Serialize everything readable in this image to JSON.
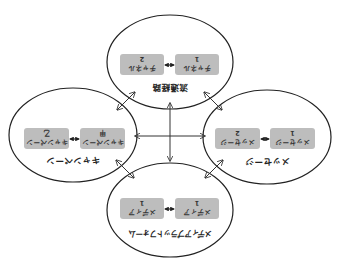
{
  "diagram": {
    "orientation": "rotated 180 degrees",
    "colors": {
      "ellipse_stroke": "#222222",
      "box_fill": "#bdbdbd",
      "arrow": "#333333",
      "background": "#ffffff"
    },
    "nodes": {
      "channel": {
        "title": "流通経路",
        "boxes": [
          {
            "line1": "チャネル",
            "line2": "1"
          },
          {
            "line1": "チャネル",
            "line2": "2"
          }
        ]
      },
      "campaign": {
        "title": "キャンペーン",
        "boxes": [
          {
            "line1": "キャンペーン",
            "line2": "甲"
          },
          {
            "line1": "キャンペーン",
            "line2": "乙"
          }
        ]
      },
      "message": {
        "title": "メッセージ",
        "boxes": [
          {
            "line1": "メッセージ",
            "line2": "1"
          },
          {
            "line1": "メッセージ",
            "line2": "2"
          }
        ]
      },
      "media": {
        "title": "メディアプラットフォーム",
        "boxes": [
          {
            "line1": "メディア",
            "line2": "1"
          },
          {
            "line1": "メディア",
            "line2": "1"
          }
        ]
      }
    },
    "connections": [
      [
        "channel",
        "media"
      ],
      [
        "campaign",
        "message"
      ],
      [
        "channel",
        "campaign"
      ],
      [
        "channel",
        "message"
      ],
      [
        "media",
        "campaign"
      ],
      [
        "media",
        "message"
      ]
    ]
  }
}
